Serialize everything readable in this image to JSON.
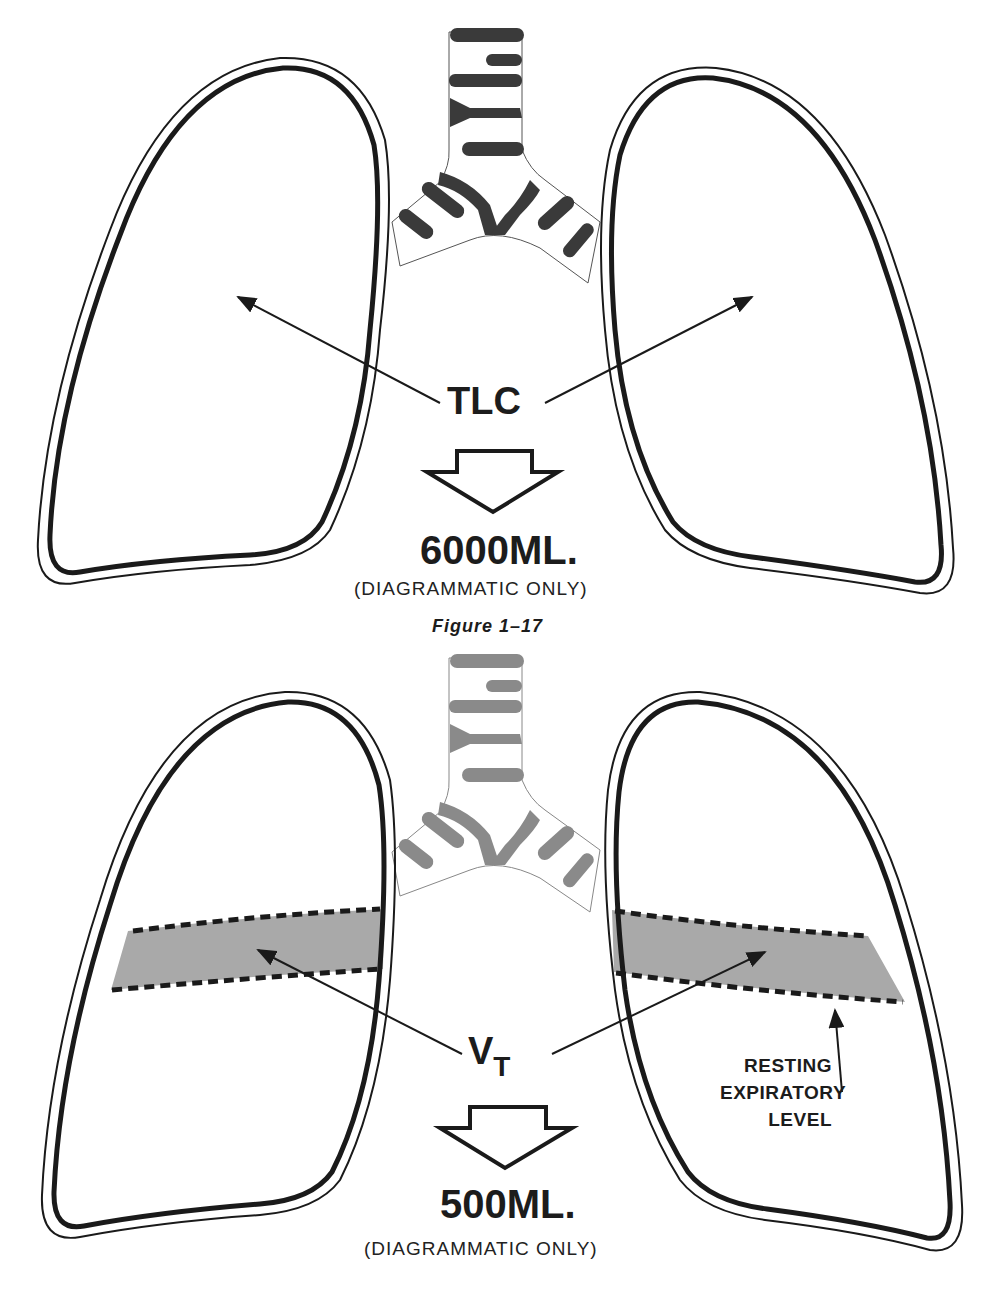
{
  "figure_top": {
    "label": "TLC",
    "volume": "6000ML.",
    "note": "(DIAGRAMMATIC ONLY)",
    "caption": "Figure 1–17",
    "airway_color": "#3a3a3a"
  },
  "figure_bottom": {
    "label_main": "V",
    "label_sub": "T",
    "volume": "500ML.",
    "note": "(DIAGRAMMATIC ONLY)",
    "side_label": [
      "RESTING",
      "EXPIRATORY",
      "LEVEL"
    ],
    "airway_color": "#8a8a8a",
    "band_color": "#a9a9a9"
  },
  "colors": {
    "outline": "#1a1a1a",
    "background": "#ffffff"
  }
}
